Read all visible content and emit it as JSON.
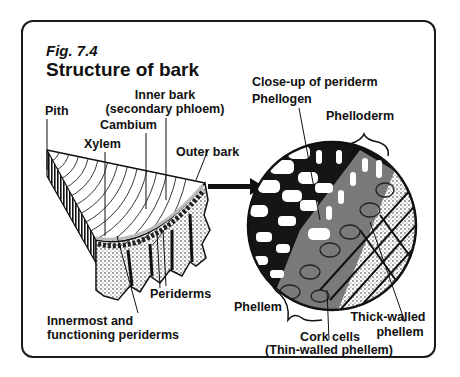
{
  "figure": {
    "number": "Fig. 7.4",
    "title": "Structure of bark"
  },
  "stem_labels": {
    "pith": "Pith",
    "inner_bark_line1": "Inner bark",
    "inner_bark_line2": "(secondary phloem)",
    "cambium": "Cambium",
    "xylem": "Xylem",
    "outer_bark": "Outer bark",
    "periderms": "Periderms",
    "innermost_line1": "Innermost and",
    "innermost_line2": "functioning periderms"
  },
  "closeup_labels": {
    "heading": "Close-up of periderm",
    "phellogen": "Phellogen",
    "phelloderm": "Phelloderm",
    "phellem": "Phellem",
    "thick_walled_line1": "Thick-walled",
    "thick_walled_line2": "phellem",
    "cork_cells_line1": "Cork cells",
    "cork_cells_line2": "(Thin-walled phellem)"
  },
  "colors": {
    "ink": "#111111",
    "frame": "#1a1a1a",
    "background": "#ffffff",
    "gray_cells": "#7a7a7a",
    "stipple": "#9a9a9a"
  }
}
